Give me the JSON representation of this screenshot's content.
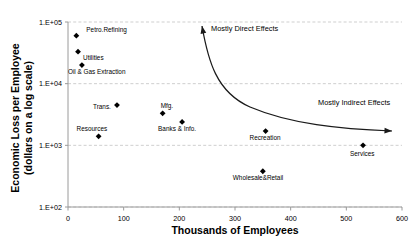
{
  "chart_data": {
    "type": "scatter",
    "title": "",
    "xlabel": "Thousands of Employees",
    "ylabel_line1": "Economic Loss per Employee",
    "ylabel_line2": "(dollars on a log scale)",
    "xlim": [
      0,
      600
    ],
    "ylim": [
      100,
      100000
    ],
    "yscale": "log",
    "grid": "horizontal-dashed",
    "legend": "none",
    "xticks": [
      "0",
      "100",
      "200",
      "300",
      "400",
      "500",
      "600"
    ],
    "xtick_values": [
      0,
      100,
      200,
      300,
      400,
      500,
      600
    ],
    "yticks": [
      "1.E+02",
      "1.E+03",
      "1.E+04",
      "1.E+05"
    ],
    "ytick_values": [
      100,
      1000,
      10000,
      100000
    ],
    "points": [
      {
        "label": "Petro.Refining",
        "x": 15,
        "y": 60000,
        "label_dx": 10,
        "label_dy": -4
      },
      {
        "label": "Utilities",
        "x": 18,
        "y": 33000,
        "label_dx": 5,
        "label_dy": 8
      },
      {
        "label": "Oil & Gas Extraction",
        "x": 25,
        "y": 20000,
        "label_dx": -14,
        "label_dy": 9
      },
      {
        "label": "Trans.",
        "x": 88,
        "y": 4500,
        "label_dx": -24,
        "label_dy": 4
      },
      {
        "label": "Mfg.",
        "x": 170,
        "y": 3300,
        "label_dx": -2,
        "label_dy": -5
      },
      {
        "label": "Banks & Info.",
        "x": 205,
        "y": 2400,
        "label_dx": -24,
        "label_dy": 9
      },
      {
        "label": "Resources",
        "x": 55,
        "y": 1400,
        "label_dx": -22,
        "label_dy": -5
      },
      {
        "label": "Recreation",
        "x": 355,
        "y": 1700,
        "label_dx": -16,
        "label_dy": 9
      },
      {
        "label": "Wholesale&Retail",
        "x": 350,
        "y": 380,
        "label_dx": -30,
        "label_dy": 9
      },
      {
        "label": "Services",
        "x": 530,
        "y": 1000,
        "label_dx": -13,
        "label_dy": 11
      }
    ],
    "annotations": [
      {
        "name": "mostly-direct-effects",
        "text": "Mostly Direct Effects"
      },
      {
        "name": "mostly-indirect-effects",
        "text": "Mostly Indirect Effects"
      }
    ]
  },
  "colors": {
    "marker": "#000000",
    "gridline": "#c9c9c9",
    "axis": "#9a9a9a",
    "curve": "#1a1a1a",
    "background": "#ffffff"
  }
}
